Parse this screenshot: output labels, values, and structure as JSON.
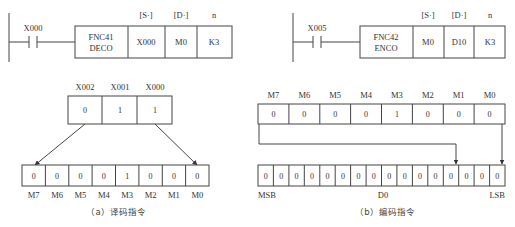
{
  "deco": {
    "contact": "X000",
    "func_code": "FNC41",
    "mnemonic": "DECO",
    "operand_headers": [
      "[S·]",
      "[D·]",
      "n"
    ],
    "operands": [
      "X000",
      "M0",
      "K3"
    ],
    "source_labels": [
      "X002",
      "X001",
      "X000"
    ],
    "source_values": [
      "0",
      "1",
      "1"
    ],
    "dest_values": [
      "0",
      "0",
      "0",
      "0",
      "1",
      "0",
      "0",
      "0"
    ],
    "dest_labels": [
      "M7",
      "M6",
      "M5",
      "M4",
      "M3",
      "M2",
      "M1",
      "M0"
    ],
    "caption": "（a）译码指令"
  },
  "enco": {
    "contact": "X005",
    "func_code": "FNC42",
    "mnemonic": "ENCO",
    "operand_headers": [
      "[S·]",
      "[D·]",
      "n"
    ],
    "operands": [
      "M0",
      "D10",
      "K3"
    ],
    "source_labels": [
      "M7",
      "M6",
      "M5",
      "M4",
      "M3",
      "M2",
      "M1",
      "M0"
    ],
    "source_values": [
      "0",
      "0",
      "0",
      "0",
      "1",
      "0",
      "0",
      "0"
    ],
    "dest_values": [
      "0",
      "0",
      "0",
      "0",
      "0",
      "0",
      "0",
      "0",
      "0",
      "0",
      "0",
      "0",
      "0",
      "0",
      "0",
      "0"
    ],
    "dest_labels": {
      "msb": "MSB",
      "mid": "D0",
      "lsb": "LSB"
    },
    "caption": "（b）编码指令"
  }
}
